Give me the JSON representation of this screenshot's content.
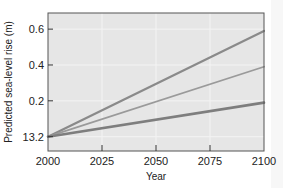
{
  "chart_data": {
    "type": "line",
    "title": "",
    "xlabel": "Year",
    "ylabel": "Predicted sea-level rise (m)",
    "x": [
      2000,
      2100
    ],
    "xticks": [
      2000,
      2025,
      2050,
      2075,
      2100
    ],
    "yticks": [
      {
        "value": 0,
        "label": "13.2"
      },
      {
        "value": 0.2,
        "label": "0.2"
      },
      {
        "value": 0.4,
        "label": "0.4"
      },
      {
        "value": 0.6,
        "label": "0.6"
      }
    ],
    "xlim": [
      2000,
      2100
    ],
    "ylim": [
      -0.08,
      0.69
    ],
    "grid": true,
    "legend": null,
    "series": [
      {
        "name": "high",
        "values": [
          0,
          0.59
        ],
        "color": "#8a8a8a",
        "width": 2.2
      },
      {
        "name": "medium",
        "values": [
          0,
          0.39
        ],
        "color": "#9a9a9a",
        "width": 1.8
      },
      {
        "name": "low",
        "values": [
          0,
          0.19
        ],
        "color": "#7e7e7e",
        "width": 2.6
      }
    ],
    "colors": {
      "plot_background": "#e6e6e6",
      "gridline": "#f4f4f4",
      "frame": "#555555"
    }
  }
}
